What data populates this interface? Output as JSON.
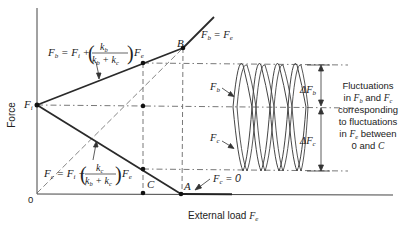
{
  "axes": {
    "y_label": "Force",
    "x_label_prefix": "External load ",
    "x_label_var": "F",
    "x_label_sub": "e",
    "origin_label": "0"
  },
  "points": {
    "Fi": {
      "label": "F",
      "sub": "i"
    },
    "A": "A",
    "B": "B",
    "C": "C"
  },
  "equations": {
    "bolt": {
      "lhs": "F",
      "lhs_sub": "b",
      "eq": " = ",
      "fi": "F",
      "fi_sub": "i",
      "op": " + ",
      "num": "k",
      "num_sub": "b",
      "den1": "k",
      "den1_sub": "b",
      "den_op": " + ",
      "den2": "k",
      "den2_sub": "c",
      "tail": "F",
      "tail_sub": "e"
    },
    "clamp": {
      "lhs": "F",
      "lhs_sub": "c",
      "eq": " = ",
      "fi": "F",
      "fi_sub": "i",
      "op": " − ",
      "num": "k",
      "num_sub": "c",
      "den1": "k",
      "den1_sub": "b",
      "den_op": " + ",
      "den2": "k",
      "den2_sub": "c",
      "tail": "F",
      "tail_sub": "e"
    },
    "fb_fe": {
      "lhs": "F",
      "lhs_sub": "b",
      "eq": " = ",
      "rhs": "F",
      "rhs_sub": "e"
    },
    "fc_zero": {
      "lhs": "F",
      "lhs_sub": "c",
      "eq": " = ",
      "rhs": "0"
    }
  },
  "waveform_labels": {
    "fb": {
      "label": "F",
      "sub": "b"
    },
    "fc": {
      "label": "F",
      "sub": "c"
    },
    "delta_fb": {
      "prefix": "Δ",
      "label": "F",
      "sub": "b"
    },
    "delta_fc": {
      "prefix": "Δ",
      "label": "F",
      "sub": "c"
    }
  },
  "annotation": {
    "lines": [
      "Fluctuations",
      "in F_b and F_c",
      "corresponding",
      "to fluctuations",
      "in F_e between",
      "0 and C"
    ],
    "line1": "Fluctuations",
    "line2_pre": "in ",
    "line2_v1": "F",
    "line2_s1": "b",
    "line2_mid": " and ",
    "line2_v2": "F",
    "line2_s2": "c",
    "line3": "corresponding",
    "line4": "to fluctuations",
    "line5_pre": "in ",
    "line5_v": "F",
    "line5_s": "e",
    "line5_post": " between",
    "line6_pre": "0 and ",
    "line6_v": "C"
  },
  "colors": {
    "line": "#2a2a2a",
    "thin": "#555555",
    "text": "#222222"
  }
}
